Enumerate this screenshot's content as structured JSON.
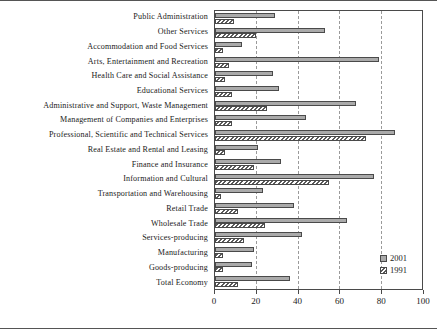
{
  "chart_data": {
    "type": "bar",
    "orientation": "horizontal",
    "title": "",
    "subtitle": "",
    "xlabel": "",
    "ylabel": "",
    "xlim": [
      0,
      100
    ],
    "xticks": [
      0,
      20,
      40,
      60,
      80,
      100
    ],
    "xtick_labels": [
      "0",
      "20",
      "40",
      "60",
      "80",
      "100"
    ],
    "grid": "vertical-dashed",
    "legend_position": "bottom-right",
    "categories": [
      "Public Administration",
      "Other Services",
      "Accommodation and Food Services",
      "Arts, Entertainment and Recreation",
      "Health Care and Social Assistance",
      "Educational Services",
      "Administrative and Support, Waste Management",
      "Management of Companies and Enterprises",
      "Professional, Scientific and Technical Services",
      "Real Estate and Rental and Leasing",
      "Finance and Insurance",
      "Information and Cultural",
      "Transportation and Warehousing",
      "Retail Trade",
      "Wholesale Trade",
      "Services-producing",
      "Manufacturing",
      "Goods-producing",
      "Total Economy"
    ],
    "series": [
      {
        "name": "2001",
        "color": "#aaaaaa",
        "pattern": "solid",
        "values": [
          29,
          53,
          13,
          79,
          28,
          31,
          68,
          44,
          87,
          21,
          32,
          77,
          23,
          38,
          64,
          42,
          19,
          18,
          36
        ]
      },
      {
        "name": "1991",
        "color": "#ffffff",
        "pattern": "diagonal-hatch",
        "values": [
          9,
          20,
          4,
          7,
          5,
          8,
          25,
          8,
          73,
          5,
          19,
          55,
          3,
          11,
          24,
          14,
          4,
          4,
          11
        ]
      }
    ]
  },
  "legend": {
    "entries": [
      {
        "label": "2001",
        "swatch": "solid-gray-swatch"
      },
      {
        "label": "1991",
        "swatch": "hatched-swatch"
      }
    ]
  }
}
